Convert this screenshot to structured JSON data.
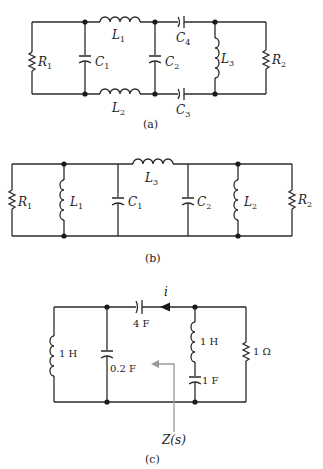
{
  "figure": {
    "panels": [
      {
        "caption": "(a)",
        "components": {
          "R1": {
            "name": "R",
            "sub": "1"
          },
          "C1": {
            "name": "C",
            "sub": "1"
          },
          "L1": {
            "name": "L",
            "sub": "1"
          },
          "C2": {
            "name": "C",
            "sub": "2"
          },
          "L2": {
            "name": "L",
            "sub": "2"
          },
          "C4": {
            "name": "C",
            "sub": "4"
          },
          "C3": {
            "name": "C",
            "sub": "3"
          },
          "L3": {
            "name": "L",
            "sub": "3"
          },
          "R2": {
            "name": "R",
            "sub": "2"
          }
        }
      },
      {
        "caption": "(b)",
        "components": {
          "R1": {
            "name": "R",
            "sub": "1"
          },
          "L1": {
            "name": "L",
            "sub": "1"
          },
          "C1": {
            "name": "C",
            "sub": "1"
          },
          "L3": {
            "name": "L",
            "sub": "3"
          },
          "C2": {
            "name": "C",
            "sub": "2"
          },
          "L2": {
            "name": "L",
            "sub": "2"
          },
          "R2": {
            "name": "R",
            "sub": "2"
          }
        }
      },
      {
        "caption": "(c)",
        "current_label": "i",
        "impedance_label": "Z(s)",
        "components": {
          "L_left": "1 H",
          "C_shunt": "0.2 F",
          "C_series": "4 F",
          "L_branch": "1 H",
          "C_branch": "1 F",
          "R_right": "1 Ω"
        }
      }
    ]
  },
  "colors": {
    "wire": "#2a2a2a",
    "arrow_gray": "#9a9a9a",
    "background": "#ffffff"
  }
}
